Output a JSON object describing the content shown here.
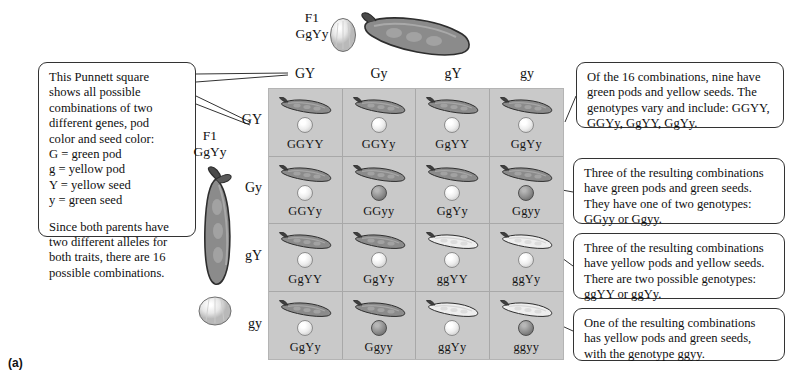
{
  "figure": {
    "label": "(a)"
  },
  "parents": {
    "top": {
      "generation": "F1",
      "genotype": "GgYy"
    },
    "left": {
      "generation": "F1",
      "genotype": "GgYy"
    }
  },
  "grid": {
    "column_headers": [
      "GY",
      "Gy",
      "gY",
      "gy"
    ],
    "row_headers": [
      "GY",
      "Gy",
      "gY",
      "gy"
    ],
    "cells": [
      {
        "genotype": "GGYY",
        "pod": "green",
        "seed": "yellow"
      },
      {
        "genotype": "GGYy",
        "pod": "green",
        "seed": "yellow"
      },
      {
        "genotype": "GgYY",
        "pod": "green",
        "seed": "yellow"
      },
      {
        "genotype": "GgYy",
        "pod": "green",
        "seed": "yellow"
      },
      {
        "genotype": "GGYy",
        "pod": "green",
        "seed": "yellow"
      },
      {
        "genotype": "GGyy",
        "pod": "green",
        "seed": "green"
      },
      {
        "genotype": "GgYy",
        "pod": "green",
        "seed": "yellow"
      },
      {
        "genotype": "Ggyy",
        "pod": "green",
        "seed": "green"
      },
      {
        "genotype": "GgYY",
        "pod": "green",
        "seed": "yellow"
      },
      {
        "genotype": "GgYy",
        "pod": "green",
        "seed": "yellow"
      },
      {
        "genotype": "ggYY",
        "pod": "yellow",
        "seed": "yellow"
      },
      {
        "genotype": "ggYy",
        "pod": "yellow",
        "seed": "yellow"
      },
      {
        "genotype": "GgYy",
        "pod": "green",
        "seed": "yellow"
      },
      {
        "genotype": "Ggyy",
        "pod": "green",
        "seed": "green"
      },
      {
        "genotype": "ggYy",
        "pod": "yellow",
        "seed": "yellow"
      },
      {
        "genotype": "ggyy",
        "pod": "yellow",
        "seed": "green"
      }
    ]
  },
  "callouts": {
    "left": {
      "paragraph_1": "This Punnett square shows all possible combinations of two different genes, pod color and seed color: G = green pod g = yellow pod Y = yellow seed y = green seed",
      "line_1": "This Punnett square",
      "line_2": "shows all possible",
      "line_3": "combinations of two",
      "line_4": "different genes, pod",
      "line_5": "color and seed color:",
      "line_6": "G = green pod",
      "line_7": "g = yellow pod",
      "line_8": "Y = yellow seed",
      "line_9": "y = green seed",
      "paragraph_2": "Since both parents have two different alleles for both traits, there are 16 possible combinations."
    },
    "right_1": "Of the 16 combinations, nine have green pods and yellow seeds. The genotypes vary and include: GGYY, GGYy, GgYY, GgYy.",
    "right_2": "Three of the resulting combinations have green pods and green seeds. They have one of two genotypes: GGyy or Ggyy.",
    "right_3": "Three of the resulting combinations have yellow pods and yellow seeds. There are two possible genotypes: ggYY or ggYy.",
    "right_4": "One of the resulting combinations has yellow pods and green seeds, with the genotype ggyy."
  },
  "colors": {
    "grid_background": "#c9c9c9",
    "green_pod": "#8a8a8a",
    "yellow_pod": "#e9e9e9",
    "yellow_seed": "#efefef",
    "green_seed": "#8c8c8c",
    "outline": "#333333"
  }
}
